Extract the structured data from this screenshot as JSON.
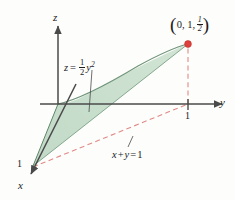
{
  "figure": {
    "kind": "3d-coordinate-surface-diagram",
    "background_color": "#fdfdfc"
  },
  "axes": {
    "z_label": "z",
    "y_label": "y",
    "x_label": "x",
    "origin": [
      58,
      104
    ],
    "z_tip": [
      58,
      22
    ],
    "y_tip": [
      228,
      104
    ],
    "x_tip": [
      28,
      178
    ]
  },
  "ticks": {
    "x_one": "1",
    "y_one": "1"
  },
  "annotations": {
    "surface_equation_prefix": "z",
    "surface_equation_eq": "=",
    "surface_equation_coef_num": "1",
    "surface_equation_coef_den": "2",
    "surface_equation_var": "y",
    "surface_equation_exp": "2",
    "plane_equation_x": "x",
    "plane_equation_plus": "+",
    "plane_equation_y": "y",
    "plane_equation_eq": "=",
    "plane_equation_rhs": "1"
  },
  "point_label": {
    "open_paren": "(",
    "close_paren": ")",
    "coord_xy": "0, 1,",
    "coord_z_num": "1",
    "coord_z_den": "2",
    "marker_color": "#e0403c",
    "marker_position": [
      188,
      44
    ]
  },
  "colors": {
    "surface_fill": "#c6dccb",
    "surface_fill_light": "#d9e8db",
    "surface_edge": "#6f9478",
    "axis": "#4a4a4a",
    "dashed_red": "#e08a86",
    "text": "#1c1c1c"
  },
  "geometry": {
    "surface_apex_x_axis": [
      33,
      166
    ],
    "surface_top_point": [
      188,
      44
    ],
    "parabola_description": "z = 0.5 y^2 rising from origin to (0,1,1/2)",
    "dashed_line_xy": "x + y = 1 from (1,0,0) to (0,1,0)",
    "dashed_vertical": "from (0,1,0) up to (0,1,1/2)"
  }
}
